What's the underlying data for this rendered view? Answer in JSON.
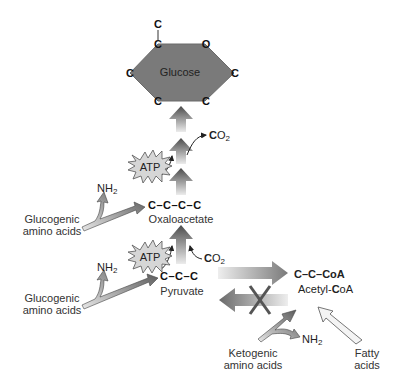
{
  "diagram": {
    "glucose": {
      "label": "Glucose",
      "atoms": {
        "top": "C",
        "top_left": "C",
        "top_right": "O",
        "right": "C",
        "bottom_right": "C",
        "bottom_left": "C",
        "left": "C"
      },
      "fill": "#7a7a7a"
    },
    "co2_upper": {
      "prefix": "C",
      "suffix": "O",
      "sub": "2"
    },
    "co2_lower": {
      "prefix": "C",
      "suffix": "O",
      "sub": "2"
    },
    "oxaloacetate": {
      "chain": "C–C–C–C",
      "label": "Oxaloacetate"
    },
    "pyruvate": {
      "chain": "C–C–C",
      "label": "Pyruvate"
    },
    "acetyl_coa": {
      "chain_prefix": "C–C–",
      "chain_bold": "C",
      "chain_suffix": "oA",
      "label_prefix": "Acetyl-",
      "label_bold": "C",
      "label_suffix": "oA"
    },
    "atp_upper": {
      "label": "ATP"
    },
    "atp_lower": {
      "label": "ATP"
    },
    "nh2_upper": {
      "main": "NH",
      "sub": "2"
    },
    "nh2_lower": {
      "main": "NH",
      "sub": "2"
    },
    "nh2_keto": {
      "main": "NH",
      "sub": "2"
    },
    "glucogenic_upper": {
      "line1": "Glucogenic",
      "line2": "amino acids"
    },
    "glucogenic_lower": {
      "line1": "Glucogenic",
      "line2": "amino acids"
    },
    "ketogenic": {
      "line1": "Ketogenic",
      "line2": "amino acids"
    },
    "fatty_acids": {
      "line1": "Fatty",
      "line2": "acids"
    },
    "blocked_reaction": {
      "from": "Acetyl-CoA",
      "to": "Pyruvate",
      "status": "blocked (X)"
    },
    "colors": {
      "arrow_dark": "#555555",
      "arrow_light": "#e6e6e6",
      "hexagon": "#7a7a7a",
      "atp_burst": "#d9d9d9",
      "text": "#222222"
    }
  }
}
